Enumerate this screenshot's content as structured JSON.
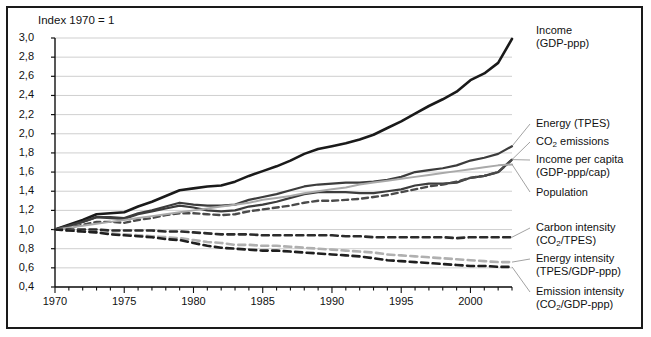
{
  "figure": {
    "note": "Index 1970 = 1",
    "axis_color": "#111111",
    "grid_color": "#c9c9c9",
    "frame_color": "#1a1a1a"
  },
  "chart_data": {
    "type": "line",
    "title": "",
    "subtitle": "Index 1970 = 1",
    "xlabel": "",
    "ylabel": "",
    "xlim": [
      1970,
      2003
    ],
    "ylim": [
      0.4,
      3.0
    ],
    "grid": true,
    "legend_position": "right-outside",
    "ytick_labels": [
      "0,4",
      "0,6",
      "0,8",
      "1,0",
      "1,2",
      "1,4",
      "1,6",
      "1,8",
      "2,0",
      "2,2",
      "2,4",
      "2,6",
      "2,8",
      "3,0"
    ],
    "ytick_values": [
      0.4,
      0.6,
      0.8,
      1.0,
      1.2,
      1.4,
      1.6,
      1.8,
      2.0,
      2.2,
      2.4,
      2.6,
      2.8,
      3.0
    ],
    "xtick_labels": [
      "1970",
      "1975",
      "1980",
      "1985",
      "1990",
      "1995",
      "2000"
    ],
    "xtick_values": [
      1970,
      1975,
      1980,
      1985,
      1990,
      1995,
      2000
    ],
    "x": [
      1970,
      1971,
      1972,
      1973,
      1974,
      1975,
      1976,
      1977,
      1978,
      1979,
      1980,
      1981,
      1982,
      1983,
      1984,
      1985,
      1986,
      1987,
      1988,
      1989,
      1990,
      1991,
      1992,
      1993,
      1994,
      1995,
      1996,
      1997,
      1998,
      1999,
      2000,
      2001,
      2002,
      2003
    ],
    "series": [
      {
        "name": "Income (GDP-ppp)",
        "label_line1": "Income",
        "label_line2": "(GDP-ppp)",
        "color": "#1a1a1a",
        "style": "solid",
        "width": 2.6,
        "label_value_end": 2.99,
        "values": [
          1.0,
          1.05,
          1.1,
          1.16,
          1.17,
          1.18,
          1.24,
          1.29,
          1.35,
          1.41,
          1.43,
          1.45,
          1.46,
          1.5,
          1.56,
          1.61,
          1.66,
          1.72,
          1.79,
          1.84,
          1.87,
          1.9,
          1.94,
          1.99,
          2.06,
          2.13,
          2.21,
          2.29,
          2.36,
          2.44,
          2.56,
          2.63,
          2.74,
          2.99
        ]
      },
      {
        "name": "Energy (TPES)",
        "label_line1": "Energy (TPES)",
        "label_line2": "",
        "color": "#3c3c3c",
        "style": "solid",
        "width": 2.2,
        "label_value_end": 2.1,
        "values": [
          1.0,
          1.04,
          1.08,
          1.13,
          1.13,
          1.12,
          1.17,
          1.2,
          1.24,
          1.28,
          1.26,
          1.25,
          1.25,
          1.26,
          1.31,
          1.34,
          1.37,
          1.41,
          1.45,
          1.47,
          1.48,
          1.49,
          1.49,
          1.5,
          1.52,
          1.55,
          1.6,
          1.62,
          1.64,
          1.67,
          1.72,
          1.75,
          1.79,
          1.87
        ]
      },
      {
        "name": "CO2 emissions",
        "label_line1": "CO₂ emissions",
        "label_line2": "",
        "color": "#3c3c3c",
        "style": "solid",
        "width": 2.2,
        "label_value_end": 1.96,
        "values": [
          1.0,
          1.04,
          1.08,
          1.13,
          1.12,
          1.11,
          1.16,
          1.19,
          1.22,
          1.25,
          1.23,
          1.2,
          1.19,
          1.2,
          1.24,
          1.26,
          1.29,
          1.33,
          1.37,
          1.39,
          1.39,
          1.39,
          1.38,
          1.38,
          1.4,
          1.42,
          1.46,
          1.48,
          1.48,
          1.49,
          1.54,
          1.56,
          1.6,
          1.73
        ]
      },
      {
        "name": "Income per capita (GDP-ppp/cap)",
        "label_line1": "Income per capita",
        "label_line2": "(GDP-ppp/cap)",
        "color": "#4a4a4a",
        "style": "dashed",
        "width": 2.4,
        "label_value_end": 1.74,
        "values": [
          1.0,
          1.02,
          1.05,
          1.08,
          1.08,
          1.07,
          1.1,
          1.12,
          1.15,
          1.17,
          1.17,
          1.16,
          1.15,
          1.16,
          1.19,
          1.21,
          1.23,
          1.25,
          1.28,
          1.3,
          1.3,
          1.31,
          1.32,
          1.34,
          1.36,
          1.39,
          1.42,
          1.45,
          1.47,
          1.5,
          1.54,
          1.56,
          1.6,
          1.73
        ]
      },
      {
        "name": "Population",
        "label_line1": "Population",
        "label_line2": "",
        "color": "#a9a9a9",
        "style": "solid",
        "width": 2.0,
        "label_value_end": 1.68,
        "values": [
          1.0,
          1.02,
          1.04,
          1.06,
          1.08,
          1.1,
          1.12,
          1.14,
          1.16,
          1.18,
          1.2,
          1.22,
          1.24,
          1.26,
          1.28,
          1.31,
          1.33,
          1.35,
          1.38,
          1.4,
          1.42,
          1.44,
          1.47,
          1.49,
          1.51,
          1.53,
          1.55,
          1.57,
          1.59,
          1.61,
          1.63,
          1.65,
          1.67,
          1.68
        ]
      },
      {
        "name": "Carbon intensity (CO2/TPES)",
        "label_line1": "Carbon intensity",
        "label_line2": "(CO₂/TPES)",
        "color": "#2b2b2b",
        "style": "dashed",
        "width": 2.6,
        "label_value_end": 0.92,
        "values": [
          1.0,
          1.0,
          1.0,
          1.0,
          0.99,
          0.99,
          0.99,
          0.99,
          0.98,
          0.98,
          0.97,
          0.96,
          0.95,
          0.95,
          0.95,
          0.94,
          0.94,
          0.94,
          0.94,
          0.94,
          0.94,
          0.93,
          0.93,
          0.92,
          0.92,
          0.92,
          0.92,
          0.92,
          0.92,
          0.91,
          0.92,
          0.92,
          0.92,
          0.92
        ]
      },
      {
        "name": "Energy intensity (TPES/GDP-ppp)",
        "label_line1": "Energy intensity",
        "label_line2": "(TPES/GDP-ppp)",
        "color": "#b0b0b0",
        "style": "dashed",
        "width": 2.6,
        "label_value_end": 0.66,
        "values": [
          1.0,
          0.99,
          0.98,
          0.97,
          0.96,
          0.95,
          0.94,
          0.93,
          0.92,
          0.91,
          0.89,
          0.87,
          0.86,
          0.84,
          0.84,
          0.83,
          0.83,
          0.82,
          0.81,
          0.8,
          0.79,
          0.78,
          0.77,
          0.76,
          0.74,
          0.73,
          0.72,
          0.71,
          0.7,
          0.69,
          0.68,
          0.67,
          0.66,
          0.66
        ]
      },
      {
        "name": "Emission intensity (CO2/GDP-ppp)",
        "label_line1": "Emission intensity",
        "label_line2": "(CO₂/GDP-ppp)",
        "color": "#1f1f1f",
        "style": "dashed",
        "width": 2.6,
        "label_value_end": 0.61,
        "values": [
          1.0,
          0.99,
          0.98,
          0.97,
          0.95,
          0.94,
          0.93,
          0.92,
          0.9,
          0.89,
          0.86,
          0.83,
          0.81,
          0.8,
          0.79,
          0.78,
          0.78,
          0.77,
          0.76,
          0.75,
          0.74,
          0.73,
          0.72,
          0.7,
          0.68,
          0.67,
          0.66,
          0.65,
          0.64,
          0.63,
          0.62,
          0.62,
          0.61,
          0.61
        ]
      }
    ]
  },
  "legend": [
    {
      "line1": "Income",
      "line2": "(GDP-ppp)"
    },
    {
      "line1": "Energy (TPES)",
      "line2": ""
    },
    {
      "line1": "CO₂ emissions",
      "line2": ""
    },
    {
      "line1": "Income per capita",
      "line2": "(GDP-ppp/cap)"
    },
    {
      "line1": "Population",
      "line2": ""
    },
    {
      "line1": "Carbon intensity",
      "line2": "(CO₂/TPES)"
    },
    {
      "line1": "Energy intensity",
      "line2": "(TPES/GDP-ppp)"
    },
    {
      "line1": "Emission intensity",
      "line2": "(CO₂/GDP-ppp)"
    }
  ]
}
